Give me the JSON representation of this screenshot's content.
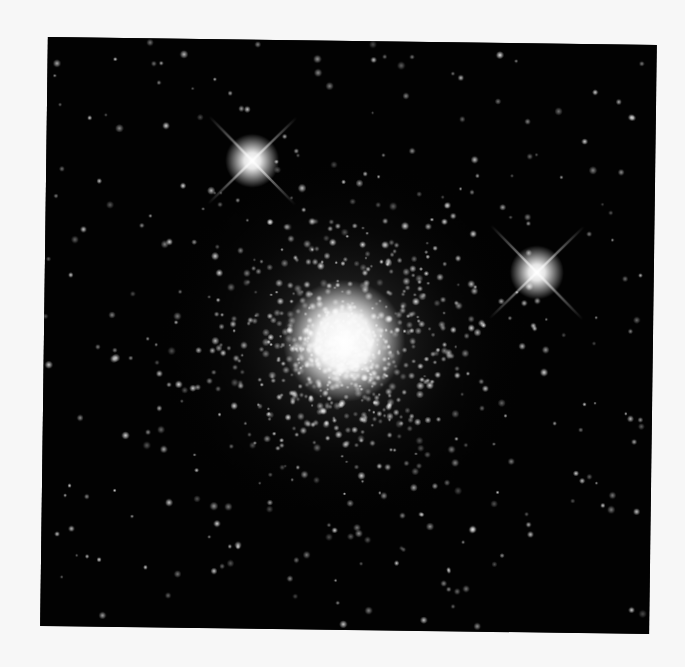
{
  "page": {
    "background": "#f7f7f7"
  },
  "photo": {
    "background": "#020202",
    "width": 609,
    "height": 589,
    "rotation_deg": 0.75,
    "cluster_core": {
      "x": 300,
      "y": 300,
      "radius": 34,
      "halo_radius": 190
    },
    "bright_stars": [
      {
        "x": 206,
        "y": 121,
        "radius": 9,
        "spike_length": 62
      },
      {
        "x": 492,
        "y": 229,
        "radius": 9,
        "spike_length": 66
      }
    ],
    "field_star_count": 260,
    "cluster_star_count": 900,
    "seed": 12345
  }
}
